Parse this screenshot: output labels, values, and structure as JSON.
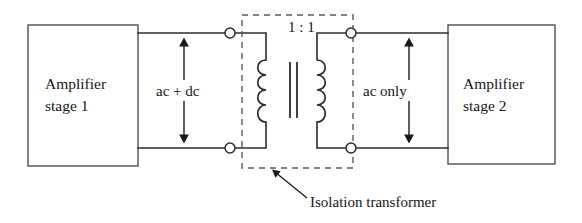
{
  "figure": {
    "background_color": "#ffffff",
    "line_color": "#2b2b2b",
    "box_stroke_color": "#5a5a5a",
    "text_color": "#151515",
    "width": 582,
    "height": 223
  },
  "left_block": {
    "line1": "Amplifier",
    "line2": "stage 1"
  },
  "right_block": {
    "line1": "Amplifier",
    "line2": "stage 2"
  },
  "left_signal": {
    "label": "ac + dc",
    "arrow_style": "double-headed-vertical"
  },
  "right_signal": {
    "label": "ac only",
    "arrow_style": "double-headed-vertical"
  },
  "transformer": {
    "ratio_label": "1 : 1",
    "primary_turns": 4,
    "secondary_turns": 4,
    "core_lines": 2,
    "terminal_count": 4,
    "enclosure_style": "dashed"
  },
  "callout": {
    "text": "Isolation transformer",
    "leader_style": "arrow"
  }
}
